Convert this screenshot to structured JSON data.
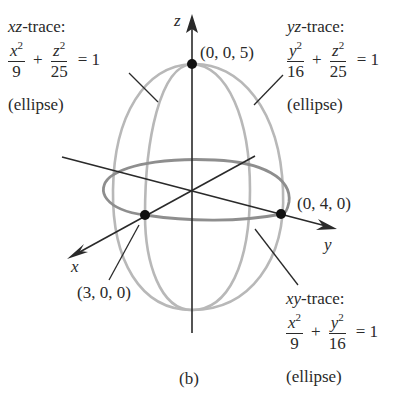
{
  "figure": {
    "caption": "(b)",
    "axes": {
      "x_label": "x",
      "y_label": "y",
      "z_label": "z"
    },
    "points": [
      {
        "label": "(0, 0, 5)",
        "coords": [
          0,
          0,
          5
        ]
      },
      {
        "label": "(0, 4, 0)",
        "coords": [
          0,
          4,
          0
        ]
      },
      {
        "label": "(3, 0, 0)",
        "coords": [
          3,
          0,
          0
        ]
      }
    ],
    "traces": {
      "xz": {
        "title_var": "xz",
        "title_suffix": "-trace:",
        "num1": "x",
        "den1": "9",
        "num2": "z",
        "den2": "25",
        "exp": "2",
        "plus": "+",
        "rhs": "= 1",
        "kind": "(ellipse)"
      },
      "yz": {
        "title_var": "yz",
        "title_suffix": "-trace:",
        "num1": "y",
        "den1": "16",
        "num2": "z",
        "den2": "25",
        "exp": "2",
        "plus": "+",
        "rhs": "= 1",
        "kind": "(ellipse)"
      },
      "xy": {
        "title_var": "xy",
        "title_suffix": "-trace:",
        "num1": "x",
        "den1": "9",
        "num2": "y",
        "den2": "16",
        "exp": "2",
        "plus": "+",
        "rhs": "= 1",
        "kind": "(ellipse)"
      }
    },
    "colors": {
      "axis": "#2a2a2a",
      "trace": "#b4b4b4",
      "xy_trace": "#8c8c8c",
      "point": "#111111"
    }
  }
}
